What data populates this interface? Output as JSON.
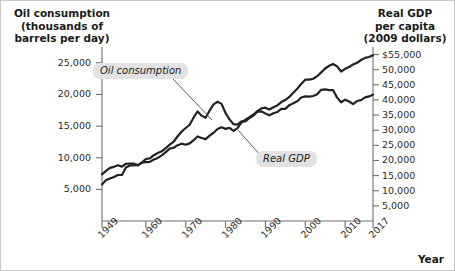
{
  "chart_data": {
    "type": "line",
    "title": "",
    "xlabel": "Year",
    "left_axis_title": "Oil consumption\n(thousands of\nbarrels per day)",
    "right_axis_title": "Real GDP\nper capita\n(2009 dollars)",
    "left_ylabel": "Oil consumption (thousands of barrels per day)",
    "right_ylabel": "Real GDP per capita (2009 dollars)",
    "grid": false,
    "legend_position": "inline-annotations",
    "xlim": [
      1949,
      2017
    ],
    "left_ylim": [
      0,
      27500
    ],
    "right_ylim": [
      0,
      57500
    ],
    "x_tick_labels": [
      "1949",
      "1960",
      "1970",
      "1980",
      "1990",
      "2000",
      "2010",
      "2017"
    ],
    "x_ticks": [
      1949,
      1960,
      1970,
      1980,
      1990,
      2000,
      2010,
      2017
    ],
    "left_tick_labels": [
      "25,000",
      "20,000",
      "15,000",
      "10,000",
      "5,000"
    ],
    "left_ticks": [
      25000,
      20000,
      15000,
      10000,
      5000
    ],
    "right_tick_labels": [
      "$55,000",
      "50,000",
      "45,000",
      "40,000",
      "35,000",
      "30,000",
      "25,000",
      "20,000",
      "15,000",
      "10,000",
      "5,000"
    ],
    "right_ticks": [
      55000,
      50000,
      45000,
      40000,
      35000,
      30000,
      25000,
      20000,
      15000,
      10000,
      5000
    ],
    "series": [
      {
        "name": "Oil consumption",
        "axis": "left",
        "units": "thousands of barrels per day",
        "color": "#222222",
        "x": [
          1949,
          1950,
          1951,
          1952,
          1953,
          1954,
          1955,
          1956,
          1957,
          1958,
          1959,
          1960,
          1961,
          1962,
          1963,
          1964,
          1965,
          1966,
          1967,
          1968,
          1969,
          1970,
          1971,
          1972,
          1973,
          1974,
          1975,
          1976,
          1977,
          1978,
          1979,
          1980,
          1981,
          1982,
          1983,
          1984,
          1985,
          1986,
          1987,
          1988,
          1989,
          1990,
          1991,
          1992,
          1993,
          1994,
          1995,
          1996,
          1997,
          1998,
          1999,
          2000,
          2001,
          2002,
          2003,
          2004,
          2005,
          2006,
          2007,
          2008,
          2009,
          2010,
          2011,
          2012,
          2013,
          2014,
          2015,
          2016,
          2017
        ],
        "values": [
          5770,
          6460,
          6720,
          6960,
          7270,
          7270,
          8460,
          8780,
          8800,
          8870,
          9230,
          9800,
          9900,
          10400,
          10740,
          11020,
          11510,
          12080,
          12560,
          13390,
          14140,
          14700,
          15210,
          16370,
          17310,
          16650,
          16320,
          17460,
          18430,
          18850,
          18510,
          17060,
          16060,
          15300,
          15230,
          15730,
          15730,
          16280,
          16670,
          17280,
          17330,
          16990,
          16710,
          17030,
          17240,
          17720,
          17720,
          18310,
          18620,
          18920,
          19520,
          19700,
          19650,
          19760,
          20030,
          20730,
          20800,
          20690,
          20680,
          19500,
          18770,
          19180,
          18880,
          18490,
          18960,
          19110,
          19530,
          19690,
          19960
        ]
      },
      {
        "name": "Real GDP",
        "axis": "right",
        "units": "2009 dollars per capita",
        "color": "#222222",
        "x": [
          1949,
          1950,
          1951,
          1952,
          1953,
          1954,
          1955,
          1956,
          1957,
          1958,
          1959,
          1960,
          1961,
          1962,
          1963,
          1964,
          1965,
          1966,
          1967,
          1968,
          1969,
          1970,
          1971,
          1972,
          1973,
          1974,
          1975,
          1976,
          1977,
          1978,
          1979,
          1980,
          1981,
          1982,
          1983,
          1984,
          1985,
          1986,
          1987,
          1988,
          1989,
          1990,
          1991,
          1992,
          1993,
          1994,
          1995,
          1996,
          1997,
          1998,
          1999,
          2000,
          2001,
          2002,
          2003,
          2004,
          2005,
          2006,
          2007,
          2008,
          2009,
          2010,
          2011,
          2012,
          2013,
          2014,
          2015,
          2016,
          2017
        ],
        "values": [
          15400,
          16550,
          17560,
          17900,
          18450,
          17980,
          18920,
          18960,
          18980,
          18370,
          19300,
          19450,
          19540,
          20320,
          20840,
          21700,
          22750,
          23900,
          24200,
          25050,
          25550,
          25200,
          25650,
          26730,
          27930,
          27430,
          27050,
          28200,
          29160,
          30400,
          30960,
          30450,
          30800,
          29760,
          30690,
          32560,
          33450,
          34280,
          35200,
          36320,
          37240,
          37440,
          36840,
          37610,
          38200,
          39310,
          39950,
          41000,
          42380,
          43700,
          45300,
          46700,
          46700,
          47000,
          47850,
          49100,
          50400,
          51300,
          51900,
          51100,
          49400,
          50300,
          50900,
          51700,
          52300,
          53200,
          53900,
          54200,
          54800
        ]
      }
    ],
    "annotations": [
      {
        "label": "Oil consumption",
        "target_year": 1973,
        "type": "callout"
      },
      {
        "label": "Real GDP",
        "target_year": 1988,
        "type": "callout"
      }
    ]
  },
  "colors": {
    "line": "#222222",
    "axis": "#6f6f6f",
    "text": "#1a1a1a",
    "label_background": "#e2e2e2",
    "frame": "#c9c9c9"
  }
}
